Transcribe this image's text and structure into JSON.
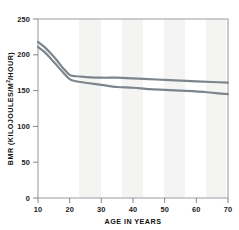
{
  "chart_data": {
    "type": "line",
    "title": "",
    "xlabel": "AGE IN YEARS",
    "ylabel": "BMR (KILOJOULES/M²/HOUR)",
    "ylabel_main": "BMR (KILOJOULES/M",
    "ylabel_sup": "2",
    "ylabel_tail": "/HOUR)",
    "xlim": [
      10,
      70
    ],
    "ylim": [
      0,
      250
    ],
    "xticks": [
      10,
      20,
      30,
      40,
      50,
      60,
      70
    ],
    "yticks": [
      0,
      50,
      100,
      150,
      200,
      250
    ],
    "xtick_labels": [
      "10",
      "20",
      "30",
      "40",
      "50",
      "60",
      "70"
    ],
    "ytick_labels": [
      "0",
      "50",
      "100",
      "150",
      "200",
      "250"
    ],
    "grid": false,
    "legend": "none",
    "line_color": "#7d858c",
    "series": [
      {
        "name": "upper-curve",
        "color": "#7d858c",
        "x": [
          10,
          12,
          14,
          16,
          18,
          20,
          22,
          25,
          30,
          35,
          40,
          45,
          50,
          55,
          60,
          65,
          70
        ],
        "values": [
          218,
          211,
          202,
          192,
          181,
          172,
          170,
          169,
          168,
          168,
          167,
          166,
          165,
          164,
          163,
          162,
          161
        ]
      },
      {
        "name": "lower-curve",
        "color": "#7d858c",
        "x": [
          10,
          12,
          14,
          16,
          18,
          20,
          22,
          25,
          30,
          35,
          40,
          45,
          50,
          55,
          60,
          65,
          70
        ],
        "values": [
          211,
          204,
          195,
          185,
          175,
          166,
          163,
          161,
          158,
          155,
          154,
          152,
          151,
          150,
          149,
          147,
          145
        ]
      }
    ]
  },
  "colors": {
    "line": "#7d858c",
    "frame": "#9aa0a4",
    "text": "#1a1a1a",
    "background": "#ffffff",
    "band": "#f4f4f3"
  }
}
